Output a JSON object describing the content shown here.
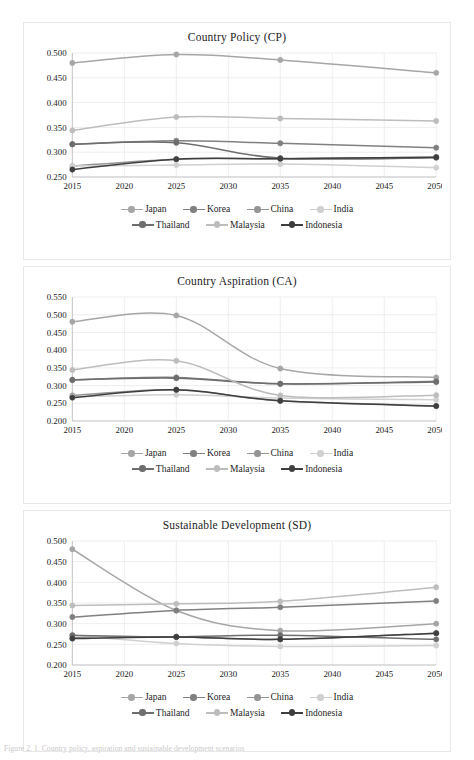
{
  "figure": {
    "caption": "Figure 2. 1. Country policy, aspiration and sustainable development scenarios"
  },
  "series_meta": [
    {
      "name": "Japan",
      "color": "#a6a6a6"
    },
    {
      "name": "Korea",
      "color": "#808080"
    },
    {
      "name": "China",
      "color": "#949494"
    },
    {
      "name": "India",
      "color": "#d0d0d0"
    },
    {
      "name": "Thailand",
      "color": "#6e6e6e"
    },
    {
      "name": "Malaysia",
      "color": "#bdbdbd"
    },
    {
      "name": "Indonesia",
      "color": "#3f3f3f"
    }
  ],
  "legend": {
    "row1": [
      "Japan",
      "Korea",
      "China",
      "India"
    ],
    "row2": [
      "Thailand",
      "Malaysia",
      "Indonesia"
    ]
  },
  "chart_data": [
    {
      "id": "cp",
      "type": "line",
      "title": "Country Policy (CP)",
      "xlabel": "",
      "ylabel": "",
      "x": [
        2015,
        2025,
        2035,
        2050
      ],
      "xlim": [
        2015,
        2050
      ],
      "xticks": [
        2015,
        2020,
        2025,
        2030,
        2035,
        2040,
        2045,
        2050
      ],
      "ylim": [
        0.25,
        0.5
      ],
      "yticks": [
        0.25,
        0.3,
        0.35,
        0.4,
        0.45,
        0.5
      ],
      "ytick_labels": [
        "0.250",
        "0.300",
        "0.350",
        "0.400",
        "0.450",
        "0.500"
      ],
      "grid": true,
      "legend_position": "bottom",
      "series": [
        {
          "name": "Japan",
          "values": [
            0.48,
            0.497,
            0.486,
            0.46
          ]
        },
        {
          "name": "Korea",
          "values": [
            0.316,
            0.323,
            0.318,
            0.309
          ]
        },
        {
          "name": "China",
          "values": [
            0.272,
            0.286,
            0.287,
            0.29
          ]
        },
        {
          "name": "India",
          "values": [
            0.272,
            0.274,
            0.276,
            0.269
          ]
        },
        {
          "name": "Thailand",
          "values": [
            0.316,
            0.319,
            0.288,
            0.289
          ]
        },
        {
          "name": "Malaysia",
          "values": [
            0.344,
            0.371,
            0.368,
            0.363
          ]
        },
        {
          "name": "Indonesia",
          "values": [
            0.265,
            0.286,
            0.287,
            0.29
          ]
        }
      ]
    },
    {
      "id": "ca",
      "type": "line",
      "title": "Country Aspiration (CA)",
      "xlabel": "",
      "ylabel": "",
      "x": [
        2015,
        2025,
        2035,
        2050
      ],
      "xlim": [
        2015,
        2050
      ],
      "xticks": [
        2015,
        2020,
        2025,
        2030,
        2035,
        2040,
        2045,
        2050
      ],
      "ylim": [
        0.2,
        0.55
      ],
      "yticks": [
        0.2,
        0.25,
        0.3,
        0.35,
        0.4,
        0.45,
        0.5,
        0.55
      ],
      "ytick_labels": [
        "0.200",
        "0.250",
        "0.300",
        "0.350",
        "0.400",
        "0.450",
        "0.500",
        "0.550"
      ],
      "grid": true,
      "legend_position": "bottom",
      "series": [
        {
          "name": "Japan",
          "values": [
            0.48,
            0.498,
            0.348,
            0.323
          ]
        },
        {
          "name": "Korea",
          "values": [
            0.316,
            0.323,
            0.305,
            0.312
          ]
        },
        {
          "name": "China",
          "values": [
            0.272,
            0.288,
            0.257,
            0.243
          ]
        },
        {
          "name": "India",
          "values": [
            0.268,
            0.274,
            0.265,
            0.26
          ]
        },
        {
          "name": "Thailand",
          "values": [
            0.316,
            0.321,
            0.305,
            0.31
          ]
        },
        {
          "name": "Malaysia",
          "values": [
            0.344,
            0.37,
            0.272,
            0.273
          ]
        },
        {
          "name": "Indonesia",
          "values": [
            0.266,
            0.288,
            0.257,
            0.242
          ]
        }
      ]
    },
    {
      "id": "sd",
      "type": "line",
      "title": "Sustainable Development (SD)",
      "xlabel": "",
      "ylabel": "",
      "x": [
        2015,
        2025,
        2035,
        2050
      ],
      "xlim": [
        2015,
        2050
      ],
      "xticks": [
        2015,
        2020,
        2025,
        2030,
        2035,
        2040,
        2045,
        2050
      ],
      "ylim": [
        0.2,
        0.5
      ],
      "yticks": [
        0.2,
        0.25,
        0.3,
        0.35,
        0.4,
        0.45,
        0.5
      ],
      "ytick_labels": [
        "0.200",
        "0.250",
        "0.300",
        "0.350",
        "0.400",
        "0.450",
        "0.500"
      ],
      "grid": true,
      "legend_position": "bottom",
      "series": [
        {
          "name": "Japan",
          "values": [
            0.48,
            0.332,
            0.283,
            0.3
          ]
        },
        {
          "name": "Korea",
          "values": [
            0.316,
            0.332,
            0.34,
            0.355
          ]
        },
        {
          "name": "China",
          "values": [
            0.266,
            0.268,
            0.262,
            0.277
          ]
        },
        {
          "name": "India",
          "values": [
            0.272,
            0.252,
            0.245,
            0.247
          ]
        },
        {
          "name": "Thailand",
          "values": [
            0.272,
            0.268,
            0.272,
            0.262
          ]
        },
        {
          "name": "Malaysia",
          "values": [
            0.344,
            0.348,
            0.354,
            0.388
          ]
        },
        {
          "name": "Indonesia",
          "values": [
            0.264,
            0.268,
            0.262,
            0.277
          ]
        }
      ]
    }
  ]
}
